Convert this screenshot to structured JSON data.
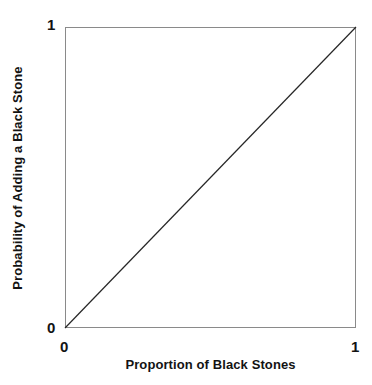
{
  "chart_data": {
    "type": "line",
    "title": "",
    "xlabel": "Proportion of Black Stones",
    "ylabel": "Probability of Adding a Black Stone",
    "xlim": [
      0,
      1
    ],
    "ylim": [
      0,
      1
    ],
    "xticks": [
      "0",
      "1"
    ],
    "yticks": [
      "0",
      "1"
    ],
    "xtick_values": [
      0,
      1
    ],
    "ytick_values": [
      0,
      1
    ],
    "grid": false,
    "legend": null,
    "series": [
      {
        "name": "identity",
        "x": [
          0,
          1
        ],
        "y": [
          0,
          1
        ],
        "color": "#262626",
        "linewidth": 1
      }
    ],
    "annotations": []
  },
  "axes": {
    "x": {
      "label": "Proportion of Black Stones",
      "tick_min": "0",
      "tick_max": "1"
    },
    "y": {
      "label": "Probability of Adding a Black Stone",
      "tick_min": "0",
      "tick_max": "1"
    }
  },
  "style": {
    "background": "#ffffff",
    "frame_color": "#8a8a8a",
    "line_color": "#262626",
    "text_color": "#131313"
  }
}
